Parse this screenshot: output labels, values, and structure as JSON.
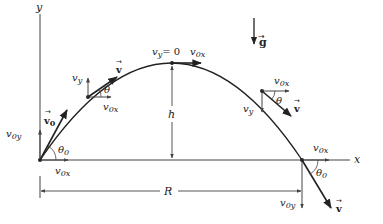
{
  "diagram": {
    "axes": {
      "x_label": "x",
      "y_label": "y"
    },
    "gravity": {
      "label": "g"
    },
    "launch": {
      "velocity_label": "v",
      "velocity_sub": "0",
      "vy_label": "v",
      "vy_sub": "0y",
      "vx_label": "v",
      "vx_sub": "0x",
      "angle_label": "θ",
      "angle_sub": "0"
    },
    "rising": {
      "velocity_label": "v",
      "vy_label": "v",
      "vy_sub": "y",
      "vx_label": "v",
      "vx_sub": "0x",
      "angle_label": "θ"
    },
    "apex": {
      "vy_label": "v",
      "vy_sub": "y",
      "vy_value": "= 0",
      "vx_label": "v",
      "vx_sub": "0x",
      "height_label": "h"
    },
    "falling": {
      "velocity_label": "v",
      "vy_label": "v",
      "vy_sub": "y",
      "vx_label": "v",
      "vx_sub": "0x",
      "angle_label": "θ"
    },
    "landing": {
      "velocity_label": "v",
      "vy_label": "v",
      "vy_sub": "0y",
      "vx_label": "v",
      "vx_sub": "0x",
      "angle_label": "θ",
      "angle_sub": "0"
    },
    "range_label": "R",
    "colors": {
      "stroke": "#222222",
      "axis": "#444444",
      "background": "#ffffff"
    }
  }
}
